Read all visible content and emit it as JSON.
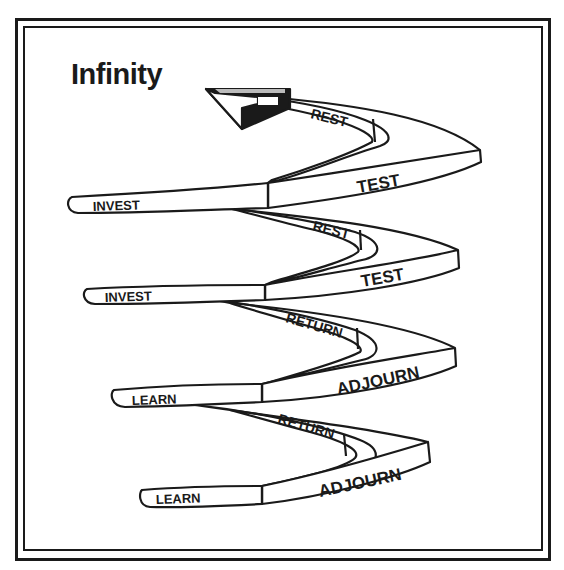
{
  "title": "Infinity",
  "colors": {
    "ink": "#1a1a1a",
    "background": "#ffffff"
  },
  "spiral": {
    "turns": [
      {
        "front_left": "INVEST",
        "front_right": "TEST",
        "back": "REST"
      },
      {
        "front_left": "INVEST",
        "front_right": "TEST",
        "back": "REST"
      },
      {
        "front_left": "LEARN",
        "front_right": "ADJOURN",
        "back": "RETURN"
      },
      {
        "front_left": "LEARN",
        "front_right": "ADJOURN",
        "back": "RETURN"
      }
    ],
    "arrow_icon": "arrow-head-icon"
  }
}
